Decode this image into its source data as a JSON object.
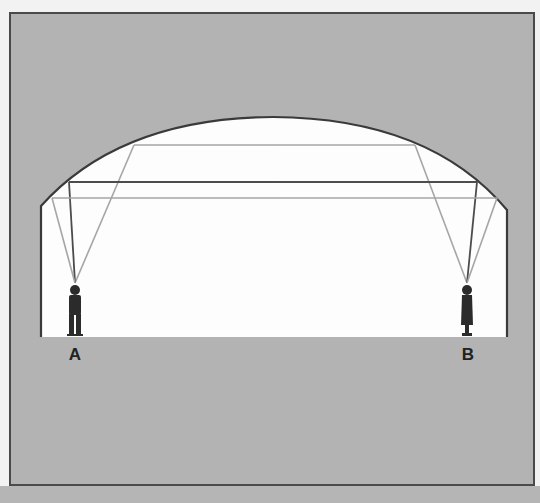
{
  "diagram": {
    "colors": {
      "background": "#f2f2f2",
      "frame_fill": "#b3b3b3",
      "frame_stroke": "#4a4a4a",
      "interior": "#fdfdfd",
      "dark_ray": "#4d4d4d",
      "light_ray": "#a6a6a6",
      "figure": "#2b2b2b",
      "strip": "#b5b5b5"
    },
    "points": [
      {
        "id": "A",
        "label": "A",
        "x": 75,
        "y": 283
      },
      {
        "id": "B",
        "label": "B",
        "x": 467,
        "y": 283
      }
    ],
    "rays": [
      {
        "id": "upper",
        "shade": "light",
        "y": 145,
        "left_reflect_x": 134,
        "right_reflect_x": 415
      },
      {
        "id": "middle",
        "shade": "dark",
        "y": 182,
        "left_reflect_x": 69,
        "right_reflect_x": 477
      },
      {
        "id": "lower",
        "shade": "light",
        "y": 198,
        "left_reflect_x": 52,
        "right_reflect_x": 497
      }
    ],
    "labels": {
      "a": "A",
      "b": "B"
    }
  }
}
